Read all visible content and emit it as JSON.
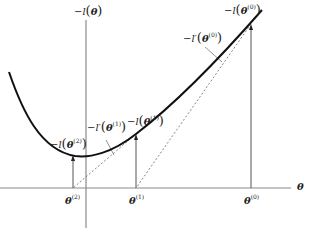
{
  "diagram": {
    "type": "newton-raphson-illustration",
    "axes": {
      "y_label": {
        "neg": "−",
        "fn": "l",
        "arg": "θ"
      },
      "x_label": "θ"
    },
    "x_ticks": [
      {
        "sym": "θ",
        "sup": "(2)"
      },
      {
        "sym": "θ",
        "sup": "(1)"
      },
      {
        "sym": "θ",
        "sup": "(0)"
      }
    ],
    "point_labels": [
      {
        "neg": "−",
        "fn": "l",
        "sym": "θ",
        "sup": "(2)"
      },
      {
        "neg": "−",
        "fn": "l",
        "sym": "θ",
        "sup": "(1)"
      },
      {
        "neg": "−",
        "fn": "l",
        "sym": "θ",
        "sup": "(0)"
      }
    ],
    "tangent_labels": [
      {
        "neg": "−",
        "fn": "l′",
        "sym": "θ",
        "sup": "(1)"
      },
      {
        "neg": "−",
        "fn": "l′",
        "sym": "θ",
        "sup": "(0)"
      }
    ],
    "colors": {
      "curve": "#111111",
      "axis": "#888888",
      "dashed": "#777777",
      "arrow": "#444444"
    }
  }
}
